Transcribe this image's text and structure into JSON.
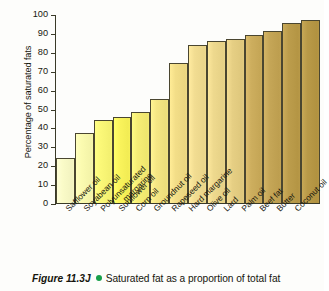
{
  "chart_data": {
    "type": "bar",
    "title": "",
    "xlabel": "",
    "ylabel": "Percentage of saturated fats",
    "ylim": [
      0,
      100
    ],
    "ytick_step": 10,
    "yticks": [
      100,
      90,
      80,
      70,
      60,
      50,
      40,
      30,
      20,
      10,
      0
    ],
    "grid": false,
    "legend": "none",
    "categories": [
      "Safflower oil",
      "Soyabean oil",
      "Polyunsaturated margarine",
      "Sunflower oil",
      "Corn oil",
      "Groundnut oil",
      "Rapeseed oil",
      "Hard margarine",
      "Olive oil",
      "Lard",
      "Palm oil",
      "Beef fat",
      "Butter",
      "Coconut oil"
    ],
    "values": [
      24,
      37.5,
      44,
      46,
      48.5,
      55.5,
      74.5,
      84,
      86,
      87,
      89.5,
      91.5,
      96,
      97.5
    ],
    "bar_colors": [
      "#fafbc8",
      "#fbfbb0",
      "#fbf878",
      "#faf45c",
      "#f7ee76",
      "#f5e684",
      "#f3de88",
      "#f2dd92",
      "#eed98e",
      "#e6cf84",
      "#cdae5e",
      "#c5a657",
      "#bc9d4c",
      "#b99a48"
    ],
    "bar_border_color": "#4a4630",
    "axis_color": "#3a3a28",
    "background": "#fdfdfb"
  },
  "xaxis": {
    "label_lines": [
      [
        "Safflower oil"
      ],
      [
        "Soyabean oil"
      ],
      [
        "Polyunsaturated",
        "margarine"
      ],
      [
        "Sunflower oil"
      ],
      [
        "Corn oil"
      ],
      [
        "Groundnut oil"
      ],
      [
        "Rapeseed oil"
      ],
      [
        "Hard margarine"
      ],
      [
        "Olive oil"
      ],
      [
        "Lard"
      ],
      [
        "Palm oil"
      ],
      [
        "Beef fat"
      ],
      [
        "Butter"
      ],
      [
        "Coconut oil"
      ]
    ]
  },
  "caption": {
    "figure_number": "Figure 11.3J",
    "bullet_color": "#17a04a",
    "text": "Saturated fat as a proportion of total fat"
  }
}
